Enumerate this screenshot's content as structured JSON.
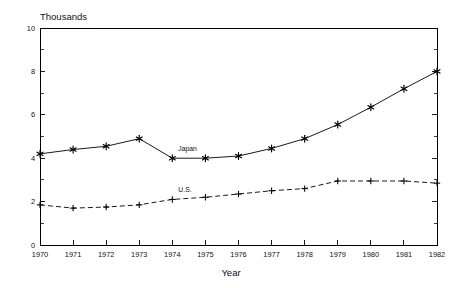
{
  "chart_data": {
    "type": "line",
    "title": "",
    "subtitle": "",
    "xlabel": "Year",
    "ylabel": "Thousands",
    "unit_label": "Thousands",
    "categories": [
      1970,
      1971,
      1972,
      1973,
      1974,
      1975,
      1976,
      1977,
      1978,
      1979,
      1980,
      1981,
      1982
    ],
    "x_tick_labels": [
      "1970",
      "1971",
      "1972",
      "1973",
      "1974",
      "1975",
      "1976",
      "1977",
      "1978",
      "1979",
      "1980",
      "1981",
      "1982"
    ],
    "y_tick_labels": [
      "0",
      "2",
      "4",
      "6",
      "8",
      "10"
    ],
    "y_major_ticks": [
      0,
      2,
      4,
      6,
      8,
      10
    ],
    "y_minor_ticks": [
      1,
      3,
      5,
      7,
      9
    ],
    "xlim": [
      1970,
      1982
    ],
    "ylim": [
      0,
      10
    ],
    "grid": false,
    "legend_position": "inline-annotations",
    "series": [
      {
        "name": "Japan",
        "marker": "star",
        "linestyle": "solid",
        "color": "#000000",
        "label_x": 1974,
        "values": [
          4.2,
          4.4,
          4.55,
          4.9,
          4.0,
          4.0,
          4.1,
          4.45,
          4.9,
          5.55,
          6.35,
          7.2,
          8.0
        ]
      },
      {
        "name": "U.S.",
        "marker": "plus",
        "linestyle": "dashed",
        "color": "#000000",
        "label_x": 1974,
        "values": [
          1.85,
          1.7,
          1.75,
          1.85,
          2.1,
          2.2,
          2.35,
          2.5,
          2.6,
          2.95,
          2.95,
          2.95,
          2.85
        ]
      }
    ],
    "annotations": [
      {
        "text": "Japan",
        "series": "Japan"
      },
      {
        "text": "U.S.",
        "series": "U.S."
      }
    ]
  },
  "plot_geometry": {
    "left": 40,
    "right": 437,
    "top": 28,
    "bottom": 245
  }
}
